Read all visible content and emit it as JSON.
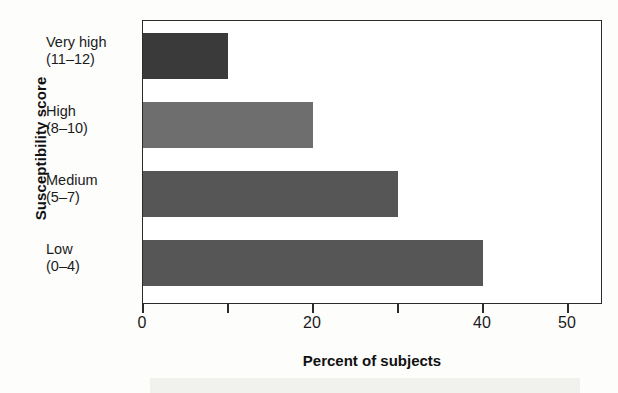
{
  "chart_data": {
    "type": "bar",
    "orientation": "horizontal",
    "title": "",
    "xlabel": "Percent of subjects",
    "ylabel": "Susceptibility score",
    "categories": [
      "Very high\n(11–12)",
      "High\n(8–10)",
      "Medium\n(5–7)",
      "Low\n(0–4)"
    ],
    "category_names": [
      "Very high",
      "High",
      "Medium",
      "Low"
    ],
    "category_ranges": [
      "(11–12)",
      "(8–10)",
      "(5–7)",
      "(0–4)"
    ],
    "values": [
      10,
      20,
      30,
      40
    ],
    "xlim": [
      0,
      54
    ],
    "xticks": [
      0,
      10,
      20,
      30,
      40,
      50
    ],
    "xtick_labels": [
      "0",
      "",
      "20",
      "",
      "40",
      "50"
    ],
    "grid": false,
    "legend": false,
    "bar_colors": [
      "#3a3a3a",
      "#6e6e6e",
      "#565656",
      "#565656"
    ],
    "series": [
      {
        "name": "Percent of subjects",
        "values": [
          10,
          20,
          30,
          40
        ]
      }
    ]
  },
  "axes": {
    "y_title": "Susceptibility score",
    "x_title": "Percent of subjects",
    "categories": [
      {
        "name": "Very high",
        "range": "(11–12)",
        "value": 10,
        "color": "#3a3a3a"
      },
      {
        "name": "High",
        "range": "(8–10)",
        "value": 20,
        "color": "#6e6e6e"
      },
      {
        "name": "Medium",
        "range": "(5–7)",
        "value": 30,
        "color": "#565656"
      },
      {
        "name": "Low",
        "range": "(0–4)",
        "value": 40,
        "color": "#565656"
      }
    ],
    "x_tick_labels": [
      {
        "label": "0",
        "value": 0
      },
      {
        "label": "",
        "value": 10
      },
      {
        "label": "20",
        "value": 20
      },
      {
        "label": "",
        "value": 30
      },
      {
        "label": "40",
        "value": 40
      },
      {
        "label": "50",
        "value": 50
      }
    ]
  },
  "colors": {
    "axis": "#2b2b2b",
    "text": "#1b1b1b",
    "background": "#ffffff"
  }
}
